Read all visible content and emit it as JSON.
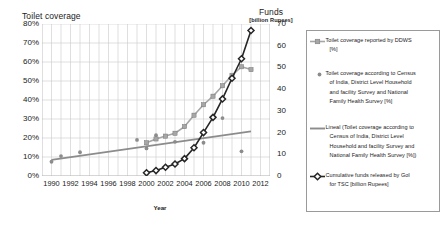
{
  "chart_data": {
    "type": "line",
    "title": "",
    "xlabel": "Year",
    "ylabel_left": "Toilet coverage",
    "ylabel_right": "Funds",
    "ylabel_right_sub": "[billion Rupees]",
    "xlim": [
      1989,
      2013
    ],
    "ylim_left": [
      0,
      80
    ],
    "ylim_right": [
      0,
      70
    ],
    "yticks_left": [
      "0%",
      "10%",
      "20%",
      "30%",
      "40%",
      "50%",
      "60%",
      "70%",
      "80%"
    ],
    "yticks_left_values": [
      0,
      10,
      20,
      30,
      40,
      50,
      60,
      70,
      80
    ],
    "yticks_right": [
      "0",
      "10",
      "20",
      "30",
      "40",
      "50",
      "60",
      "70"
    ],
    "yticks_right_values": [
      0,
      10,
      20,
      30,
      40,
      50,
      60,
      70
    ],
    "xticks": [
      "1990",
      "1992",
      "1994",
      "1996",
      "1998",
      "2000",
      "2002",
      "2004",
      "2006",
      "2008",
      "2010",
      "2012"
    ],
    "xticks_values": [
      1990,
      1992,
      1994,
      1996,
      1998,
      2000,
      2002,
      2004,
      2006,
      2008,
      2010,
      2012
    ],
    "grid": true,
    "legend_position": "right",
    "series": [
      {
        "name": "Toilet coverage reported by DDWS [%]",
        "type": "line-marker",
        "axis": "left",
        "color": "#a6a6a6",
        "marker": "square",
        "points": [
          [
            2000,
            17.5
          ],
          [
            2001,
            19.5
          ],
          [
            2002,
            21.0
          ],
          [
            2003,
            22.5
          ],
          [
            2004,
            26.0
          ],
          [
            2005,
            32.0
          ],
          [
            2006,
            37.5
          ],
          [
            2007,
            42.0
          ],
          [
            2008,
            47.5
          ],
          [
            2009,
            53.0
          ],
          [
            2010,
            57.5
          ],
          [
            2011,
            56.0
          ]
        ]
      },
      {
        "name": "Toilet coverage according to Census of India, District Level Household and facility Survey and National Family Health Survey [%]",
        "type": "scatter",
        "axis": "left",
        "color": "#8c8c8c",
        "marker": "circle",
        "points": [
          [
            1990,
            7.5
          ],
          [
            1991,
            10.5
          ],
          [
            1993,
            12.5
          ],
          [
            1999,
            19.0
          ],
          [
            2000,
            14.5
          ],
          [
            2001,
            21.5
          ],
          [
            2002,
            21.0
          ],
          [
            2003,
            18.0
          ],
          [
            2006,
            17.5
          ],
          [
            2008,
            30.5
          ],
          [
            2010,
            13.0
          ]
        ]
      },
      {
        "name": "Lineal (Toilet coverage according to Census of India, District Level Household and facility Survey and National Family Health Survey [%])",
        "type": "trendline",
        "axis": "left",
        "color": "#8c8c8c",
        "points": [
          [
            1990,
            8.5
          ],
          [
            2011,
            23.5
          ]
        ]
      },
      {
        "name": "Cumulative funds released by GoI for TSC [billion Rupees]",
        "type": "line-marker",
        "axis": "right",
        "color": "#262626",
        "marker": "diamond",
        "points": [
          [
            2000,
            1.5
          ],
          [
            2001,
            2.5
          ],
          [
            2002,
            4.0
          ],
          [
            2003,
            5.5
          ],
          [
            2004,
            8.0
          ],
          [
            2005,
            13.0
          ],
          [
            2006,
            20.0
          ],
          [
            2007,
            27.0
          ],
          [
            2008,
            35.5
          ],
          [
            2009,
            45.0
          ],
          [
            2010,
            54.0
          ],
          [
            2011,
            67.0
          ]
        ]
      }
    ],
    "legend_entries": [
      {
        "id": "ddws",
        "label": "Toilet coverage reported by DDWS [%]",
        "lines": [
          "Toilet coverage reported by DDWS",
          "[%]"
        ],
        "marker": "line-square",
        "color": "#a6a6a6"
      },
      {
        "id": "census",
        "label": "Toilet coverage according to Census of India, District Level Household and facility Survey and National Family Health Survey [%]",
        "lines": [
          "Toilet coverage according to Census",
          "of India,  District Level Household",
          "and facility Survey and National",
          "Family Health Survey [%]"
        ],
        "marker": "dot",
        "color": "#8c8c8c"
      },
      {
        "id": "lineal",
        "label": "Lineal (Toilet coverage according to Census of India, District Level Household and facility Survey and National Family Health Survey [%])",
        "lines": [
          "Lineal (Toilet coverage according to",
          "Census of India,  District Level",
          "Household and facility Survey and",
          "National Family Health Survey [%])"
        ],
        "marker": "line",
        "color": "#8c8c8c"
      },
      {
        "id": "funds",
        "label": "Cumulative funds released by GoI for TSC [billion Rupees]",
        "lines": [
          "Cumulative funds released by GoI",
          "for TSC [billion Rupees]"
        ],
        "marker": "line-diamond",
        "color": "#262626"
      }
    ]
  }
}
